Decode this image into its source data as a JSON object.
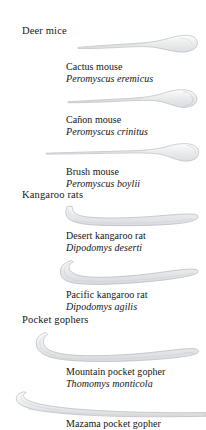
{
  "plate": {
    "title_groups": [
      {
        "label": "Deer mice",
        "top": 25,
        "name": "group-header-deer-mice"
      },
      {
        "label": "Kangaroo rats",
        "top": 189,
        "name": "group-header-kangaroo-rats"
      },
      {
        "label": "Pocket gophers",
        "top": 314,
        "name": "group-header-pocket-gophers"
      }
    ],
    "specimens": [
      {
        "id": "cactus-mouse",
        "group": "Deer mice",
        "common_name": "Cactus mouse",
        "scientific_name": "Peromyscus eremicus",
        "caption_top": 61,
        "bone_top": 33,
        "bone_left": 76,
        "bone_width": 124,
        "bone_height": 24,
        "bone_style": "club",
        "bone_color": "#e9eaec",
        "bone_outline": "#b9bcc1"
      },
      {
        "id": "canon-mouse",
        "group": "Deer mice",
        "common_name": "Cañon mouse",
        "scientific_name": "Peromyscus crinitus",
        "caption_top": 114,
        "bone_top": 88,
        "bone_left": 66,
        "bone_width": 134,
        "bone_height": 22,
        "bone_style": "knob",
        "bone_color": "#eaebed",
        "bone_outline": "#b7babf"
      },
      {
        "id": "brush-mouse",
        "group": "Deer mice",
        "common_name": "Brush mouse",
        "scientific_name": "Peromyscus boylii",
        "caption_top": 166,
        "bone_top": 142,
        "bone_left": 44,
        "bone_width": 156,
        "bone_height": 22,
        "bone_style": "club",
        "bone_color": "#ebecee",
        "bone_outline": "#b9bcc1"
      },
      {
        "id": "desert-kangaroo-rat",
        "group": "Kangaroo rats",
        "common_name": "Desert kangaroo rat",
        "scientific_name": "Dipodomys deserti",
        "caption_top": 230,
        "bone_top": 204,
        "bone_left": 62,
        "bone_width": 138,
        "bone_height": 26,
        "bone_style": "blade",
        "bone_color": "#eaebed",
        "bone_outline": "#b5b8bd"
      },
      {
        "id": "pacific-kangaroo-rat",
        "group": "Kangaroo rats",
        "common_name": "Pacific kangaroo rat",
        "scientific_name": "Dipodomys agilis",
        "caption_top": 289,
        "bone_top": 259,
        "bone_left": 58,
        "bone_width": 142,
        "bone_height": 30,
        "bone_style": "blade",
        "bone_color": "#e8e9eb",
        "bone_outline": "#b3b6bb"
      },
      {
        "id": "mountain-pocket-gopher",
        "group": "Pocket gophers",
        "common_name": "Mountain pocket gopher",
        "scientific_name": "Thomomys monticola",
        "caption_top": 366,
        "bone_top": 331,
        "bone_left": 34,
        "bone_width": 166,
        "bone_height": 34,
        "bone_style": "longblade",
        "bone_color": "#e9eaec",
        "bone_outline": "#b4b7bc"
      },
      {
        "id": "mazama-pocket-gopher",
        "group": "Pocket gophers",
        "common_name": "Mazama pocket gopher",
        "scientific_name": "",
        "caption_top": 418,
        "bone_top": 390,
        "bone_left": 14,
        "bone_width": 192,
        "bone_height": 28,
        "bone_style": "slim",
        "bone_color": "#ebecee",
        "bone_outline": "#b6b9be"
      }
    ]
  }
}
